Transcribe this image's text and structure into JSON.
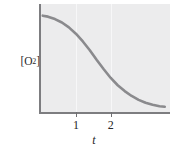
{
  "chart_data": {
    "type": "line",
    "title": "",
    "subtitle": "",
    "xlabel": "t",
    "ylabel": "[O2]",
    "ylabel_base": "[O",
    "ylabel_sub": "2",
    "ylabel_close": "]",
    "xticks": [
      "1",
      "2"
    ],
    "xtick_values": [
      1,
      2
    ],
    "yticks": [],
    "xlim": [
      0,
      3.7
    ],
    "ylim": [
      0,
      1.12
    ],
    "grid": "faint-vertical-only",
    "legend": "none",
    "annotations": [],
    "series": [
      {
        "name": "[O2] vs t",
        "x": [
          0.05,
          0.2,
          0.4,
          0.6,
          0.8,
          1.0,
          1.2,
          1.4,
          1.6,
          1.8,
          2.0,
          2.2,
          2.4,
          2.6,
          2.8,
          3.0,
          3.2,
          3.4,
          3.55
        ],
        "y": [
          1.0,
          0.99,
          0.965,
          0.93,
          0.88,
          0.815,
          0.735,
          0.645,
          0.545,
          0.45,
          0.36,
          0.285,
          0.225,
          0.175,
          0.135,
          0.105,
          0.085,
          0.07,
          0.065
        ]
      }
    ]
  },
  "axes": {
    "y_axis_label_text": "[O2]",
    "x_axis_label_text": "t",
    "tick_1_label": "1",
    "tick_2_label": "2"
  },
  "colors": {
    "panel_background": "#ececed",
    "gridline": "#f7f7f8",
    "axis_line": "#7d7d80",
    "curve": "#8a8a8d",
    "tick_mark": "#6f6f72",
    "text": "#262626",
    "page_background": "#ffffff"
  }
}
